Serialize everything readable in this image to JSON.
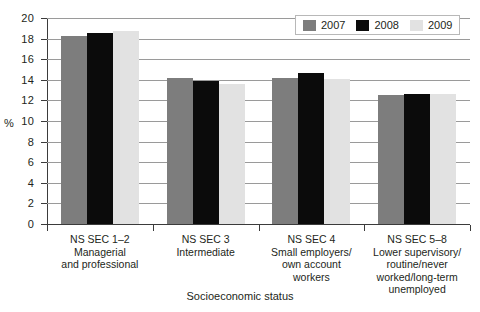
{
  "chart_data": {
    "type": "bar",
    "title": "",
    "subtitle": "",
    "xlabel": "Socioeconomic status",
    "ylabel": "%",
    "ylim": [
      0,
      20
    ],
    "ytick_step": 2,
    "yticks": [
      "0",
      "2",
      "4",
      "6",
      "8",
      "10",
      "12",
      "14",
      "16",
      "18",
      "20"
    ],
    "grid": true,
    "grid_axis": "y",
    "legend_position": "top-right",
    "categories": [
      "NS SEC 1–2 Managerial and professional",
      "NS SEC 3 Intermediate",
      "NS SEC 4 Small employers/ own account workers",
      "NS SEC 5–8 Lower supervisory/ routine/never worked/long-term unemployed"
    ],
    "category_lines": [
      [
        "NS SEC 1–2",
        "Managerial",
        "and professional"
      ],
      [
        "NS SEC 3",
        "Intermediate"
      ],
      [
        "NS SEC 4",
        "Small employers/",
        "own account",
        "workers"
      ],
      [
        "NS SEC 5–8",
        "Lower supervisory/",
        "routine/never",
        "worked/long-term",
        "unemployed"
      ]
    ],
    "series": [
      {
        "name": "2007",
        "color": "#7d7d7d",
        "values": [
          18.3,
          14.2,
          14.2,
          12.5
        ]
      },
      {
        "name": "2008",
        "color": "#0b0b0b",
        "values": [
          18.5,
          13.9,
          14.7,
          12.6
        ]
      },
      {
        "name": "2009",
        "color": "#e2e2e2",
        "values": [
          18.7,
          13.6,
          14.1,
          12.6
        ]
      }
    ]
  },
  "legend": {
    "items": [
      {
        "label": "2007",
        "color": "#7d7d7d"
      },
      {
        "label": "2008",
        "color": "#0b0b0b"
      },
      {
        "label": "2009",
        "color": "#e2e2e2"
      }
    ]
  },
  "axes": {
    "y_title": "%",
    "x_title": "Socioeconomic status"
  },
  "colors": {
    "series_2007": "#7d7d7d",
    "series_2008": "#0b0b0b",
    "series_2009": "#e2e2e2",
    "gridline": "#9a9a9a",
    "axis": "#3b3b3b",
    "text": "#231f20",
    "background": "#ffffff"
  }
}
